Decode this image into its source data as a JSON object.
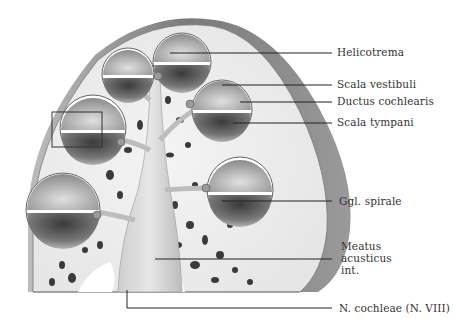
{
  "figure": {
    "labels": [
      {
        "id": "helicotrema",
        "text": "Helicotrema"
      },
      {
        "id": "scala-vestibuli",
        "text": "Scala vestibuli"
      },
      {
        "id": "ductus-cochlearis",
        "text": "Ductus cochlearis"
      },
      {
        "id": "scala-tympani",
        "text": "Scala tympani"
      },
      {
        "id": "ggl-spirale",
        "text": "Ggl. spirale"
      },
      {
        "id": "meatus-acusticus-int",
        "lines": [
          "Meatus",
          "acusticus",
          "int."
        ]
      },
      {
        "id": "n-cochleae",
        "text": "N. cochleae (N. VIII)"
      }
    ]
  }
}
